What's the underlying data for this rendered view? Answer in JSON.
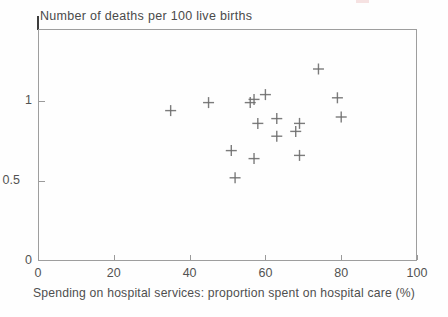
{
  "chart_data": {
    "type": "scatter",
    "title": "Number of deaths per 100 live births",
    "xlabel": "Spending on hospital services: proportion spent on hospital care (%)",
    "ylabel": "",
    "marker": "plus",
    "marker_color": "#6e6e6e",
    "axis_color": "#9e9e9e",
    "text_color": "#4f4f4f",
    "grid": false,
    "legend": null,
    "xlim": [
      0,
      100
    ],
    "ylim": [
      0,
      1.45
    ],
    "xticks": [
      {
        "value": 0,
        "label": "0"
      },
      {
        "value": 20,
        "label": "20"
      },
      {
        "value": 40,
        "label": "40"
      },
      {
        "value": 60,
        "label": "60"
      },
      {
        "value": 80,
        "label": "80"
      },
      {
        "value": 100,
        "label": "100"
      }
    ],
    "yticks": [
      {
        "value": 0,
        "label": "0"
      },
      {
        "value": 0.5,
        "label": "0.5"
      },
      {
        "value": 1,
        "label": "1"
      }
    ],
    "points": [
      {
        "x": 35,
        "y": 0.94
      },
      {
        "x": 45,
        "y": 0.99
      },
      {
        "x": 51,
        "y": 0.69
      },
      {
        "x": 52,
        "y": 0.52
      },
      {
        "x": 56,
        "y": 0.99
      },
      {
        "x": 57,
        "y": 1.01
      },
      {
        "x": 57,
        "y": 0.64
      },
      {
        "x": 58,
        "y": 0.86
      },
      {
        "x": 60,
        "y": 1.04
      },
      {
        "x": 63,
        "y": 0.89
      },
      {
        "x": 63,
        "y": 0.78
      },
      {
        "x": 68,
        "y": 0.81
      },
      {
        "x": 69,
        "y": 0.86
      },
      {
        "x": 69,
        "y": 0.66
      },
      {
        "x": 74,
        "y": 1.2
      },
      {
        "x": 79,
        "y": 1.02
      },
      {
        "x": 80,
        "y": 0.9
      }
    ]
  },
  "artifacts": {
    "smudge_color": "#f3d8d8"
  }
}
